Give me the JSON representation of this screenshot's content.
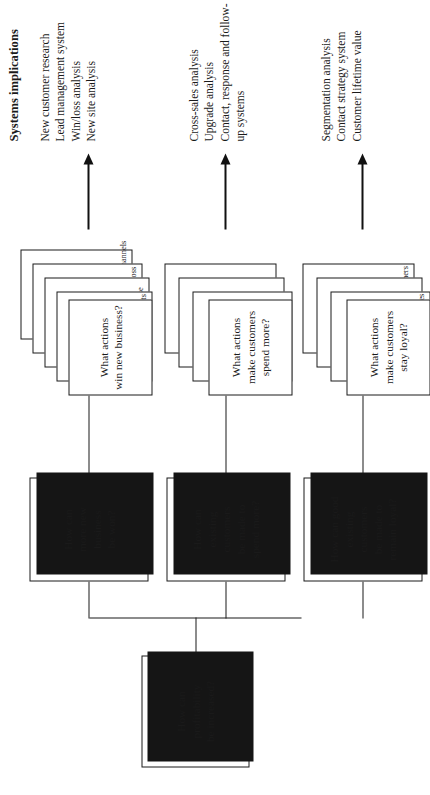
{
  "diagram": {
    "orientation": "rotated-90-ccw",
    "root": {
      "label": "How can\nprofitability\nbe increased?"
    },
    "branches": [
      {
        "question": "How can\nmore new\nbusiness\nbe won?",
        "action": "What actions\nwin new business?",
        "sub_actions": [
          "Identify likely prospects",
          "Manage leads to close",
          "Identify reasons for loss",
          "Identify good new channels"
        ],
        "implications": "New customer research\nLead management system\nWin/loss analysis\nNew site analysis"
      },
      {
        "question": "How can\nexisting\ncustomers\nbe made to\nspend more?",
        "action": "What actions\nmake customers\nspend more?",
        "sub_actions": [
          "Identify cross-sales",
          "Identify upgrades",
          "Maintain a dialogue"
        ],
        "implications": "Cross-sales analysis\nUpgrade analysis\nContact, response and follow-up systems"
      },
      {
        "question": "How can good\nexisting\ncustomers\nbe made to\nremain loyal?",
        "action": "What actions\nmake customers\nstay loyal?",
        "sub_actions": [
          "Make relevant messages",
          "Maintain a dialogue",
          "Identify good customers"
        ],
        "implications": "Segmentation analysis\nContact strategy system\nCustomer lifetime value"
      }
    ],
    "implications_heading": "Systems implications",
    "colors": {
      "ink": "#1a1a1a",
      "shadow": "#151515",
      "paper": "#ffffff"
    }
  }
}
